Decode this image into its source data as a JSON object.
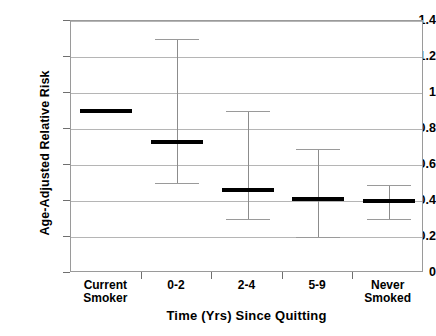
{
  "chart_data": {
    "type": "scatter",
    "title": "",
    "xlabel": "Time (Yrs) Since Quitting",
    "ylabel": "Age-Adjusted Relative Risk",
    "categories": [
      "Current\nSmoker",
      "0-2",
      "2-4",
      "5-9",
      "Never\nSmoked"
    ],
    "values": [
      0.9,
      0.73,
      0.46,
      0.41,
      0.4
    ],
    "error_low": [
      null,
      0.5,
      0.3,
      0.2,
      0.3
    ],
    "error_high": [
      null,
      1.3,
      0.9,
      0.69,
      0.49
    ],
    "ylim": [
      0,
      1.4
    ],
    "yticks": [
      0,
      0.2,
      0.4,
      0.6,
      0.8,
      1,
      1.2,
      1.4
    ],
    "ytick_labels": [
      "0",
      "0.2",
      "0.4",
      "0.6",
      "0.8",
      "1",
      "1.2",
      "1.4"
    ],
    "grid": true,
    "legend": false,
    "marker_color": "#000000",
    "errorbar_color": "#8c8c8c",
    "grid_color": "#b5b5b5",
    "axis_color": "#9a9a9a",
    "background": "#ffffff"
  }
}
